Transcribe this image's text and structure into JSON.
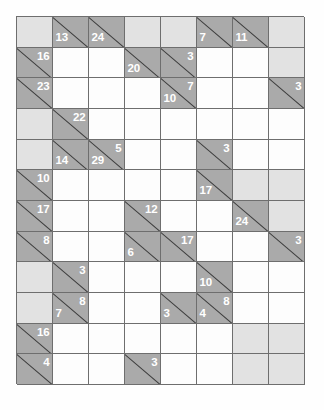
{
  "puzzle": {
    "type": "kakuro",
    "title": "Kakuro Grid",
    "columns": 8,
    "rows": 12,
    "legend": {
      "open_cell": "white fillable cell",
      "clue_cell": "dark gray cell split by diagonal, top-right = across sum, bottom-left = down sum",
      "blank_cell": "light gray unused cell"
    },
    "colors": {
      "clue_fill": "#aaaaaa",
      "blank_fill": "#e2e2e2",
      "open_fill": "#fdfdfd",
      "grid_line": "#6e6e6e",
      "diagonal": "#3c3c3c",
      "clue_text": "#ffffff"
    },
    "cells": [
      [
        {
          "t": "blank"
        },
        {
          "t": "clue",
          "across": "",
          "down": "13"
        },
        {
          "t": "clue",
          "across": "",
          "down": "24"
        },
        {
          "t": "blank"
        },
        {
          "t": "blank"
        },
        {
          "t": "clue",
          "across": "",
          "down": "7"
        },
        {
          "t": "clue",
          "across": "",
          "down": "11"
        },
        {
          "t": "blank"
        }
      ],
      [
        {
          "t": "clue",
          "across": "16",
          "down": ""
        },
        {
          "t": "open"
        },
        {
          "t": "open"
        },
        {
          "t": "clue",
          "across": "",
          "down": "20"
        },
        {
          "t": "clue",
          "across": "3",
          "down": ""
        },
        {
          "t": "open"
        },
        {
          "t": "open"
        },
        {
          "t": "blank"
        }
      ],
      [
        {
          "t": "clue",
          "across": "23",
          "down": ""
        },
        {
          "t": "open"
        },
        {
          "t": "open"
        },
        {
          "t": "open"
        },
        {
          "t": "clue",
          "across": "7",
          "down": "10"
        },
        {
          "t": "open"
        },
        {
          "t": "open"
        },
        {
          "t": "clue",
          "across": "3",
          "down": ""
        }
      ],
      [
        {
          "t": "blank"
        },
        {
          "t": "clue",
          "across": "22",
          "down": ""
        },
        {
          "t": "open"
        },
        {
          "t": "open"
        },
        {
          "t": "open"
        },
        {
          "t": "open"
        },
        {
          "t": "open"
        },
        {
          "t": "open"
        }
      ],
      [
        {
          "t": "blank"
        },
        {
          "t": "clue",
          "across": "",
          "down": "14"
        },
        {
          "t": "clue",
          "across": "5",
          "down": "29"
        },
        {
          "t": "open"
        },
        {
          "t": "open"
        },
        {
          "t": "clue",
          "across": "3",
          "down": ""
        },
        {
          "t": "open"
        },
        {
          "t": "open"
        }
      ],
      [
        {
          "t": "clue",
          "across": "10",
          "down": ""
        },
        {
          "t": "open"
        },
        {
          "t": "open"
        },
        {
          "t": "open"
        },
        {
          "t": "open"
        },
        {
          "t": "clue",
          "across": "",
          "down": "17"
        },
        {
          "t": "blank"
        },
        {
          "t": "blank"
        }
      ],
      [
        {
          "t": "clue",
          "across": "17",
          "down": ""
        },
        {
          "t": "open"
        },
        {
          "t": "open"
        },
        {
          "t": "clue",
          "across": "12",
          "down": ""
        },
        {
          "t": "open"
        },
        {
          "t": "open"
        },
        {
          "t": "clue",
          "across": "",
          "down": "24"
        },
        {
          "t": "blank"
        }
      ],
      [
        {
          "t": "clue",
          "across": "8",
          "down": ""
        },
        {
          "t": "open"
        },
        {
          "t": "open"
        },
        {
          "t": "clue",
          "across": "",
          "down": "6"
        },
        {
          "t": "clue",
          "across": "17",
          "down": ""
        },
        {
          "t": "open"
        },
        {
          "t": "open"
        },
        {
          "t": "clue",
          "across": "3",
          "down": ""
        }
      ],
      [
        {
          "t": "blank"
        },
        {
          "t": "clue",
          "across": "3",
          "down": ""
        },
        {
          "t": "open"
        },
        {
          "t": "open"
        },
        {
          "t": "open"
        },
        {
          "t": "clue",
          "across": "",
          "down": "10"
        },
        {
          "t": "open"
        },
        {
          "t": "open"
        }
      ],
      [
        {
          "t": "blank"
        },
        {
          "t": "clue",
          "across": "8",
          "down": "7"
        },
        {
          "t": "open"
        },
        {
          "t": "open"
        },
        {
          "t": "clue",
          "across": "",
          "down": "3"
        },
        {
          "t": "clue",
          "across": "8",
          "down": "4"
        },
        {
          "t": "open"
        },
        {
          "t": "open"
        }
      ],
      [
        {
          "t": "clue",
          "across": "16",
          "down": ""
        },
        {
          "t": "open"
        },
        {
          "t": "open"
        },
        {
          "t": "open"
        },
        {
          "t": "open"
        },
        {
          "t": "open"
        },
        {
          "t": "blank"
        },
        {
          "t": "blank"
        }
      ],
      [
        {
          "t": "clue",
          "across": "4",
          "down": ""
        },
        {
          "t": "open"
        },
        {
          "t": "open"
        },
        {
          "t": "clue",
          "across": "3",
          "down": ""
        },
        {
          "t": "open"
        },
        {
          "t": "open"
        },
        {
          "t": "blank"
        },
        {
          "t": "blank"
        }
      ]
    ]
  }
}
